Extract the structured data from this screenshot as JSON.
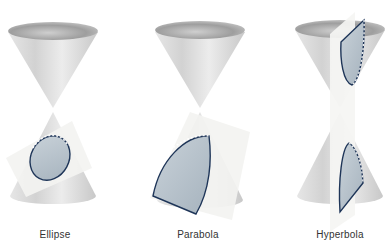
{
  "figure": {
    "panels": [
      {
        "label": "Ellipse",
        "section_type": "ellipse"
      },
      {
        "label": "Parabola",
        "section_type": "parabola"
      },
      {
        "label": "Hyperbola",
        "section_type": "hyperbola"
      }
    ],
    "colors": {
      "background": "#ffffff",
      "cone_light": "#f2f2f2",
      "cone_dark": "#9a9a9a",
      "plane": "#f4f4f2",
      "section_fill": "#b9c4cc",
      "section_outline": "#1e3558"
    }
  }
}
